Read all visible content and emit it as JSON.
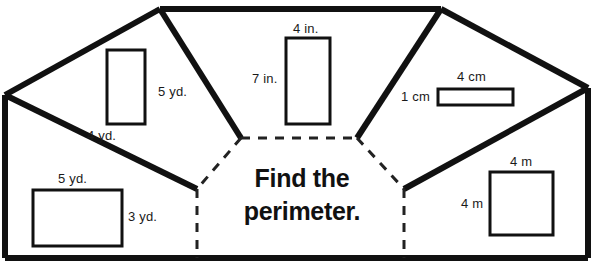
{
  "worksheet": {
    "prompt_line1": "Find the",
    "prompt_line2": "perimeter.",
    "prompt": "Find the perimeter.",
    "ink_color": "#111111",
    "background_color": "#ffffff"
  },
  "figures": [
    {
      "name": "rectangle-5yd-4yd",
      "shape": "rectangle",
      "unit": "yd.",
      "width_label": "4 yd.",
      "height_label": "5 yd.",
      "width_value": 4,
      "height_value": 5,
      "label_positions": {
        "width": "bottom",
        "height": "right"
      }
    },
    {
      "name": "rectangle-7in-4in",
      "shape": "rectangle",
      "unit": "in.",
      "width_label": "4 in.",
      "height_label": "7 in.",
      "width_value": 4,
      "height_value": 7,
      "label_positions": {
        "width": "top",
        "height": "left"
      }
    },
    {
      "name": "rectangle-4cm-1cm",
      "shape": "rectangle",
      "unit": "cm",
      "width_label": "4 cm",
      "height_label": "1 cm",
      "width_value": 4,
      "height_value": 1,
      "label_positions": {
        "width": "top",
        "height": "left"
      }
    },
    {
      "name": "rectangle-5yd-3yd",
      "shape": "rectangle",
      "unit": "yd.",
      "width_label": "5 yd.",
      "height_label": "3 yd.",
      "width_value": 5,
      "height_value": 3,
      "label_positions": {
        "width": "top",
        "height": "right"
      }
    },
    {
      "name": "square-4m",
      "shape": "square",
      "unit": "m",
      "width_label": "4 m",
      "height_label": "4 m",
      "width_value": 4,
      "height_value": 4,
      "label_positions": {
        "width": "top",
        "height": "left"
      }
    }
  ]
}
